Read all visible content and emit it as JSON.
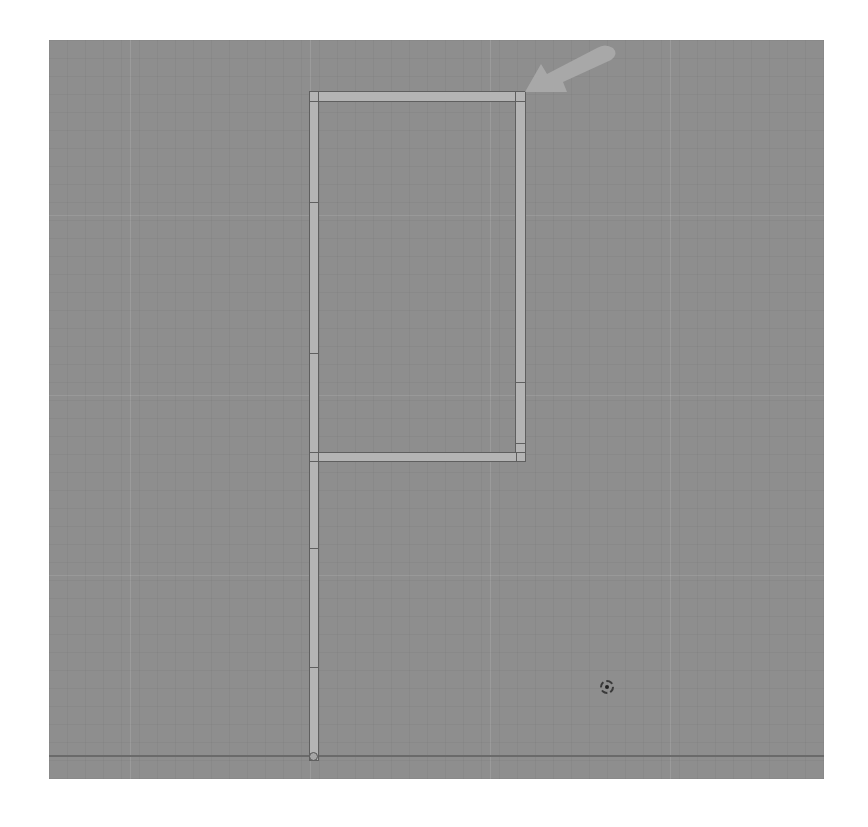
{
  "viewport": {
    "name": "3D Viewport (Top Orthographic)",
    "background_color": "#8e8e8e",
    "bar_color": "#b4b4b4",
    "edge_color": "#5f5f5f",
    "arrow_color": "#a8a8a8"
  },
  "object": {
    "shape": "P-shaped rectangular bar frame",
    "bars": [
      {
        "id": "left-post",
        "orientation": "vertical"
      },
      {
        "id": "top-rail",
        "orientation": "horizontal"
      },
      {
        "id": "right-post",
        "orientation": "vertical"
      },
      {
        "id": "middle-rail",
        "orientation": "horizontal"
      }
    ]
  },
  "annotation": {
    "type": "arrow",
    "points_to": "top-right corner of frame"
  },
  "cursor": {
    "type": "3d-cursor"
  },
  "origin": {
    "type": "object-origin"
  }
}
